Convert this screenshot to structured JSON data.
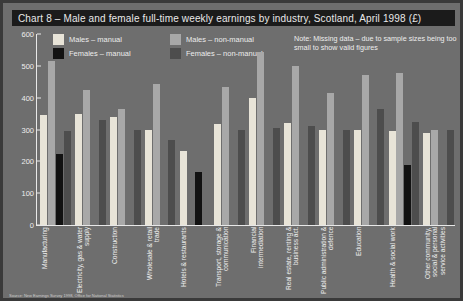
{
  "title": "Chart 8 – Male and female full-time weekly earnings by industry, Scotland, April 1998 (£)",
  "note": "Note: Missing data – due to sample sizes being too small to show valid figures",
  "footer": "Source: New Earnings Survey 1998, Office for National Statistics",
  "colors": {
    "background": "#6e6e6e",
    "frame_border": "#3a3a3a",
    "title_background": "#1b1b1b",
    "title_text": "#e9e9e9",
    "axis": "#e8e8e8",
    "males_manual": "#e8e4d8",
    "females_manual": "#121212",
    "males_non_manual": "#a8a8a8",
    "females_non_manual": "#4d4d4d"
  },
  "legend": [
    {
      "label": "Males – manual",
      "color": "#e8e4d8",
      "key": "males_manual"
    },
    {
      "label": "Males – non-manual",
      "color": "#a8a8a8",
      "key": "males_non_manual"
    },
    {
      "label": "Females – manual",
      "color": "#121212",
      "key": "females_manual"
    },
    {
      "label": "Females – non-manual",
      "color": "#4d4d4d",
      "key": "females_non_manual"
    }
  ],
  "chart_data": {
    "type": "bar",
    "title": "Chart 8 – Male and female full-time weekly earnings by industry, Scotland, April 1998 (£)",
    "xlabel": "",
    "ylabel": "",
    "ylim": [
      0,
      600
    ],
    "yticks": [
      0,
      100,
      200,
      300,
      400,
      500,
      600
    ],
    "grid": false,
    "legend_position": "top-left",
    "annotation": "Note: Missing data – due to sample sizes being too small to show valid figures",
    "categories": [
      "Manufacturing",
      "Electricity, gas & water supply",
      "Construction",
      "Wholesale & retail trade",
      "Hotels & restaurants",
      "Transport, storage & communication",
      "Financial intermediation",
      "Real estate, renting & business act.",
      "Public administration & defence",
      "Education",
      "Health & social work",
      "Other community, social & personal service activities"
    ],
    "series": [
      {
        "name": "Males – manual",
        "color": "#e8e4d8",
        "values": [
          345,
          350,
          340,
          298,
          233,
          318,
          400,
          322,
          297,
          300,
          295,
          290
        ]
      },
      {
        "name": "Females – manual",
        "color": "#121212",
        "values": [
          222,
          null,
          null,
          null,
          165,
          null,
          null,
          null,
          null,
          null,
          190,
          null
        ]
      },
      {
        "name": "Males – non-manual",
        "color": "#a8a8a8",
        "values": [
          515,
          425,
          365,
          442,
          null,
          435,
          545,
          500,
          415,
          470,
          478,
          300
        ]
      },
      {
        "name": "Females – non-manual",
        "color": "#4d4d4d",
        "values": [
          295,
          330,
          300,
          268,
          null,
          298,
          305,
          312,
          300,
          365,
          325,
          298
        ]
      }
    ]
  }
}
